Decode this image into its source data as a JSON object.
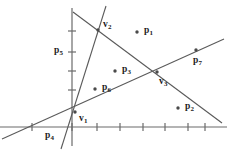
{
  "figure": {
    "width": 227,
    "height": 152,
    "background_color": "#ffffff",
    "stroke_color": "#5a5a5a",
    "axis_color": "#6b6b6b",
    "text_color": "#1c1c1c",
    "point_color": "#4a4a4a"
  },
  "axes": {
    "x_axis": {
      "name": "x-axis",
      "y_pixel": 127,
      "x_start": 0,
      "x_end": 227,
      "tick_half_length": 4,
      "ticks": [
        32,
        72,
        97,
        120,
        143,
        165,
        188,
        205
      ]
    },
    "y_axis": {
      "name": "y-axis",
      "x_pixel": 72,
      "y_start": 8,
      "y_end": 146,
      "tick_half_length": 4,
      "ticks": [
        31,
        52,
        71,
        90
      ]
    },
    "origin": {
      "x": 72,
      "y": 127
    }
  },
  "lines": [
    {
      "id": "line-steep",
      "name": "steep-line",
      "description": "near-vertical line through v1 and v2",
      "x1": 106,
      "y1": 6,
      "x2": 61,
      "y2": 149
    },
    {
      "id": "line-descending",
      "name": "descending-line",
      "description": "line descending left-to-right through v2 and v3",
      "x1": 73,
      "y1": 12,
      "x2": 222,
      "y2": 123
    },
    {
      "id": "line-ascending",
      "name": "ascending-line",
      "description": "line ascending left-to-right through v1 and v3",
      "x1": 2,
      "y1": 139,
      "x2": 224,
      "y2": 39
    }
  ],
  "points": [
    {
      "id": "p1",
      "name": "point-p1",
      "label": "p",
      "sub": "1",
      "x": 137,
      "y": 32,
      "label_dx": 7,
      "label_dy": -6,
      "dot": true
    },
    {
      "id": "p2",
      "name": "point-p2",
      "label": "p",
      "sub": "2",
      "x": 178,
      "y": 108,
      "label_dx": 7,
      "label_dy": -6,
      "dot": true
    },
    {
      "id": "p3",
      "name": "point-p3",
      "label": "p",
      "sub": "3",
      "x": 115,
      "y": 71,
      "label_dx": 7,
      "label_dy": -6,
      "dot": true
    },
    {
      "id": "p4",
      "name": "point-p4",
      "label": "p",
      "sub": "4",
      "x": 52,
      "y": 127,
      "label_dx": -7,
      "label_dy": 4,
      "dot": false
    },
    {
      "id": "p5",
      "name": "point-p5",
      "label": "p",
      "sub": "5",
      "x": 72,
      "y": 52,
      "label_dx": -18,
      "label_dy": -6,
      "dot": false
    },
    {
      "id": "p6",
      "name": "point-p6",
      "label": "p",
      "sub": "6",
      "x": 95,
      "y": 89,
      "label_dx": 7,
      "label_dy": -6,
      "dot": true
    },
    {
      "id": "p7",
      "name": "point-p7",
      "label": "p",
      "sub": "7",
      "x": 196,
      "y": 50,
      "label_dx": -3,
      "label_dy": 6,
      "dot": true
    }
  ],
  "vertices": [
    {
      "id": "v1",
      "name": "vertex-v1",
      "label": "v",
      "sub": "1",
      "x": 75,
      "y": 112,
      "label_dx": 4,
      "label_dy": 2,
      "dot": true
    },
    {
      "id": "v2",
      "name": "vertex-v2",
      "label": "v",
      "sub": "2",
      "x": 98,
      "y": 30,
      "label_dx": 5,
      "label_dy": -10,
      "dot": true
    },
    {
      "id": "v3",
      "name": "vertex-v3",
      "label": "v",
      "sub": "3",
      "x": 157,
      "y": 72,
      "label_dx": 2,
      "label_dy": 5,
      "dot": true
    }
  ]
}
